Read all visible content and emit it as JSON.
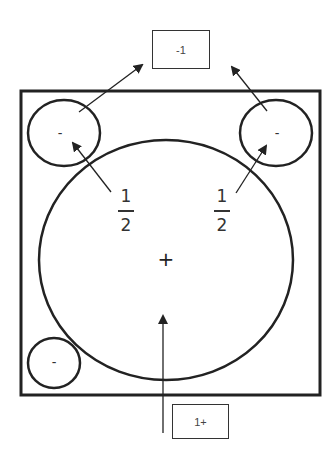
{
  "diagram": {
    "top_box": {
      "label": "-1"
    },
    "bottom_box": {
      "label": "1+"
    },
    "small_circles": [
      {
        "position": "top-left",
        "sign": "-"
      },
      {
        "position": "top-right",
        "sign": "-"
      },
      {
        "position": "bottom-left",
        "sign": "-"
      }
    ],
    "large_circle": {
      "sign": "+"
    },
    "fractions": [
      {
        "position": "left",
        "numerator": "1",
        "denominator": "2"
      },
      {
        "position": "right",
        "numerator": "1",
        "denominator": "2"
      }
    ],
    "colors": {
      "stroke": "#222222",
      "background": "#ffffff"
    }
  }
}
